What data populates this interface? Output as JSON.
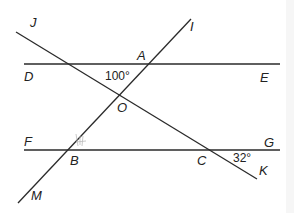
{
  "diagram": {
    "type": "geometry-parallel-lines-transversals",
    "points": {
      "J": "J",
      "I": "I",
      "A": "A",
      "D": "D",
      "E": "E",
      "O": "O",
      "F": "F",
      "G": "G",
      "B": "B",
      "C": "C",
      "M": "M",
      "K": "K"
    },
    "angles": {
      "angle_A_interior": "100°",
      "angle_C": "32°"
    },
    "lines": [
      "DE",
      "FG",
      "JK",
      "MI"
    ],
    "line_color": "#2a2a2a"
  }
}
